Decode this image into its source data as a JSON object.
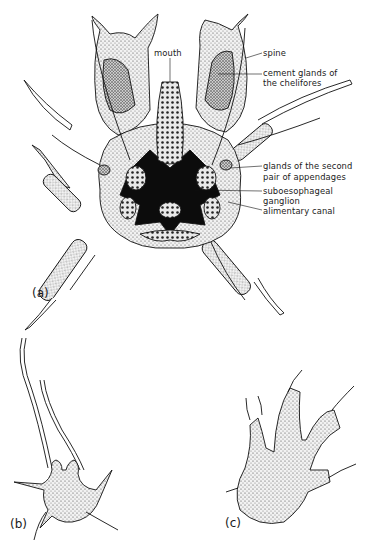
{
  "figure": {
    "panels": [
      {
        "id": "a",
        "label": "(a)"
      },
      {
        "id": "b",
        "label": "(b)"
      },
      {
        "id": "c",
        "label": "(c)"
      }
    ],
    "annotations": {
      "spine": "spine",
      "cement_glands_1": "cement glands of",
      "cement_glands_2": "the chelifores",
      "mouth": "mouth",
      "glands_second_1": "glands of the second",
      "glands_second_2": "pair of appendages",
      "suboesophageal_1": "suboesophageal",
      "suboesophageal_2": "ganglion",
      "alimentary_canal": "alimentary canal"
    },
    "colors": {
      "ink": "#111111",
      "stipple": "#555555",
      "background": "#ffffff"
    }
  }
}
